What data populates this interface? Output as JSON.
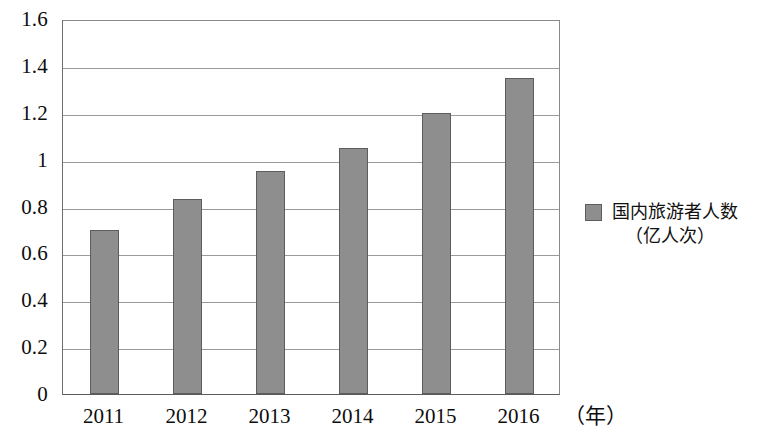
{
  "chart_data": {
    "type": "bar",
    "title": "",
    "subtitle": "",
    "xlabel": "年",
    "ylabel": "",
    "categories": [
      "2011",
      "2012",
      "2013",
      "2014",
      "2015",
      "2016"
    ],
    "values": [
      0.7,
      0.83,
      0.95,
      1.05,
      1.2,
      1.35
    ],
    "series": [
      {
        "name": "国内旅游者人数（亿人次）",
        "values": [
          0.7,
          0.83,
          0.95,
          1.05,
          1.2,
          1.35
        ]
      }
    ],
    "ylim": [
      0,
      1.6
    ],
    "ytick_values": [
      0,
      0.2,
      0.4,
      0.6,
      0.8,
      1.0,
      1.2,
      1.4,
      1.6
    ],
    "ytick_labels": [
      "0",
      "0.2",
      "0.4",
      "0.6",
      "0.8",
      "1",
      "1.2",
      "1.4",
      "1.6"
    ],
    "grid": true,
    "grid_axis": "y",
    "legend_position": "right",
    "bar_color": "#8e8e8e",
    "bar_border_color": "#5d5d5d",
    "gridline_color": "#9a9a9a",
    "axis_color": "#5a5a5a"
  },
  "axis": {
    "y_ticks": [
      {
        "label": "1.6",
        "value": 1.6
      },
      {
        "label": "1.4",
        "value": 1.4
      },
      {
        "label": "1.2",
        "value": 1.2
      },
      {
        "label": "1",
        "value": 1.0
      },
      {
        "label": "0.8",
        "value": 0.8
      },
      {
        "label": "0.6",
        "value": 0.6
      },
      {
        "label": "0.4",
        "value": 0.4
      },
      {
        "label": "0.2",
        "value": 0.2
      },
      {
        "label": "0",
        "value": 0
      }
    ],
    "x_ticks": [
      {
        "label": "2011"
      },
      {
        "label": "2012"
      },
      {
        "label": "2013"
      },
      {
        "label": "2014"
      },
      {
        "label": "2015"
      },
      {
        "label": "2016"
      }
    ],
    "x_unit": "（年）"
  },
  "legend": {
    "items": [
      {
        "label_main": "国内旅游者人数",
        "label_unit": "（亿人次）",
        "color": "#8e8e8e"
      }
    ]
  }
}
